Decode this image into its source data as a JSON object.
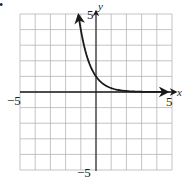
{
  "chart_data": {
    "type": "line",
    "title": "",
    "xlabel": "x",
    "ylabel": "y",
    "xlim": [
      -5,
      5
    ],
    "ylim": [
      -5,
      5
    ],
    "grid": true,
    "grid_step": 1,
    "tick_labels": {
      "x_min": "−5",
      "x_max": "5",
      "y_min": "−5",
      "y_max": "5"
    },
    "function": "y = (1/4)^x",
    "series": [
      {
        "name": "exponential decay",
        "x": [
          -1.15,
          -1,
          -0.5,
          0,
          0.5,
          1,
          1.5,
          2,
          3,
          4,
          4.7
        ],
        "y": [
          4.93,
          4.0,
          2.0,
          1.0,
          0.5,
          0.25,
          0.125,
          0.06,
          0.02,
          0.0,
          0.0
        ],
        "arrow_start": true,
        "arrow_end": true
      }
    ],
    "legend": []
  },
  "colors": {
    "grid": "#b5b5b5",
    "axis": "#1a1a1a",
    "curve": "#1a1a1a",
    "background": "#ffffff"
  },
  "marker": "•"
}
